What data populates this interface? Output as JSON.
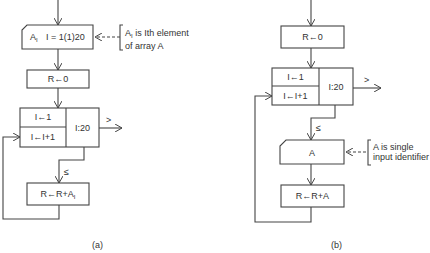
{
  "flowchart_a": {
    "caption": "(a)",
    "input_box": {
      "label": "A",
      "label_sub": "I",
      "range": "I = 1(1)20"
    },
    "annotation": {
      "line1_main": "A",
      "line1_sub": "I",
      "line1_rest": " is Ith element",
      "line2": "of array A"
    },
    "init_box": "R←0",
    "loop_box": {
      "init": "I←1",
      "increment": "I←I+1",
      "test": "I:20"
    },
    "exit_label": ">",
    "continue_label": "≤",
    "accumulate_box": {
      "main": "R←R+A",
      "sub": "I"
    }
  },
  "flowchart_b": {
    "caption": "(b)",
    "init_box": "R←0",
    "loop_box": {
      "init": "I←1",
      "increment": "I←I+1",
      "test": "I:20"
    },
    "exit_label": ">",
    "continue_label": "≤",
    "input_box": {
      "label": "A"
    },
    "annotation": {
      "line1": "A is single",
      "line2": "input identifier"
    },
    "accumulate_box": "R←R+A"
  },
  "colors": {
    "stroke": "#444444",
    "text": "#333333",
    "background": "#ffffff"
  }
}
